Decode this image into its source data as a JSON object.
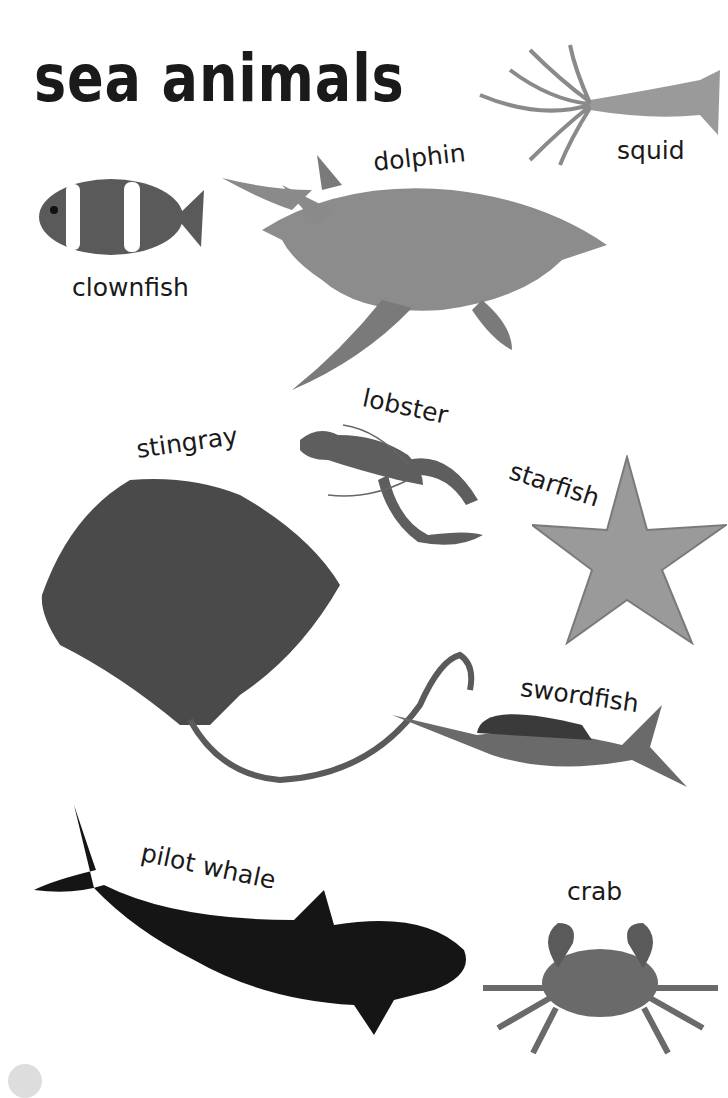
{
  "page": {
    "title": "sea animals"
  },
  "animals": [
    {
      "id": "squid",
      "label": "squid"
    },
    {
      "id": "dolphin",
      "label": "dolphin"
    },
    {
      "id": "clownfish",
      "label": "clownfish"
    },
    {
      "id": "lobster",
      "label": "lobster"
    },
    {
      "id": "stingray",
      "label": "stingray"
    },
    {
      "id": "starfish",
      "label": "starfish"
    },
    {
      "id": "swordfish",
      "label": "swordfish"
    },
    {
      "id": "pilot_whale",
      "label": "pilot whale"
    },
    {
      "id": "crab",
      "label": "crab"
    }
  ],
  "colors": {
    "text": "#1a1a1a",
    "background": "#ffffff"
  }
}
